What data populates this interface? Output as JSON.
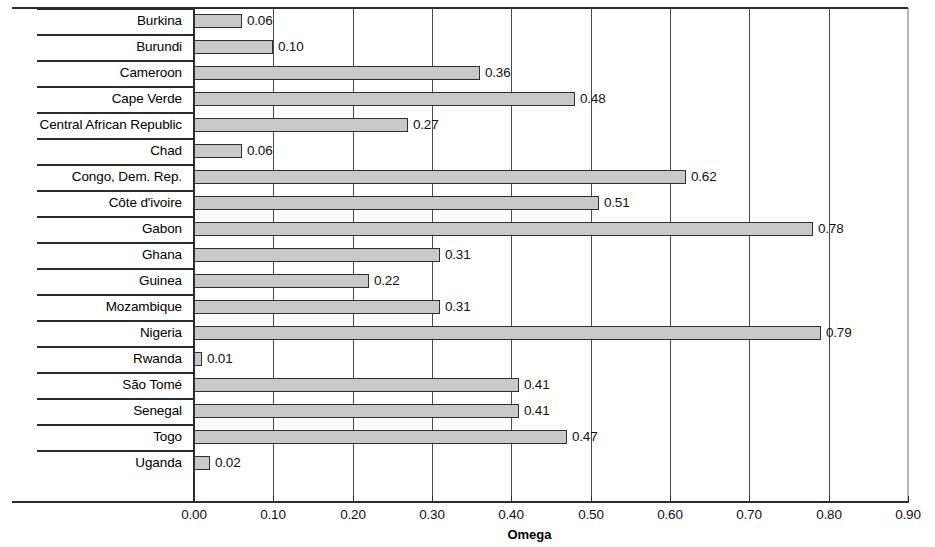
{
  "chart_data": {
    "type": "bar",
    "orientation": "horizontal",
    "title": "",
    "xlabel": "Omega",
    "ylabel": "",
    "xlim": [
      0.0,
      0.9
    ],
    "xticks": [
      "0.00",
      "0.10",
      "0.20",
      "0.30",
      "0.40",
      "0.50",
      "0.60",
      "0.70",
      "0.80",
      "0.90"
    ],
    "xtick_values": [
      0.0,
      0.1,
      0.2,
      0.3,
      0.4,
      0.5,
      0.6,
      0.7,
      0.8,
      0.9
    ],
    "grid": true,
    "grid_axis": "x",
    "legend": null,
    "categories": [
      "Burkina",
      "Burundi",
      "Cameroon",
      "Cape Verde",
      "Central African Republic",
      "Chad",
      "Congo, Dem. Rep.",
      "Côte d'ivoire",
      "Gabon",
      "Ghana",
      "Guinea",
      "Mozambique",
      "Nigeria",
      "Rwanda",
      "São Tomé",
      "Senegal",
      "Togo",
      "Uganda"
    ],
    "values": [
      0.06,
      0.1,
      0.36,
      0.48,
      0.27,
      0.06,
      0.62,
      0.51,
      0.78,
      0.31,
      0.22,
      0.31,
      0.79,
      0.01,
      0.41,
      0.41,
      0.47,
      0.02
    ],
    "value_labels": [
      "0.06",
      "0.10",
      "0.36",
      "0.48",
      "0.27",
      "0.06",
      "0.62",
      "0.51",
      "0.78",
      "0.31",
      "0.22",
      "0.31",
      "0.79",
      "0.01",
      "0.41",
      "0.41",
      "0.47",
      "0.02"
    ],
    "bar_fill_color": "#c9c9c9",
    "bar_edge_color": "#2f2f2f",
    "axis_color": "#2b2b2b",
    "background_color": "#ffffff"
  }
}
